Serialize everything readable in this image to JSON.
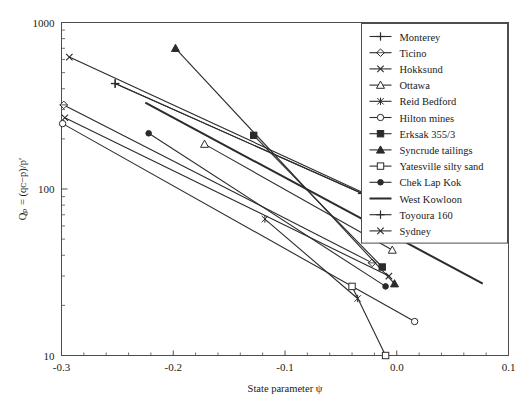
{
  "figure": {
    "background": "#ffffff",
    "frame_color": "#4d4d4d",
    "line_color": "#2b2b2b"
  },
  "axes": {
    "x": {
      "label": "State parameter ψ",
      "ticklabels": [
        "-0.3",
        "-0.2",
        "-0.1",
        "0.0",
        "0.1"
      ],
      "tickvalues": [
        -0.3,
        -0.2,
        -0.1,
        0.0,
        0.1
      ],
      "min": -0.3,
      "max": 0.1,
      "scale": "linear"
    },
    "y": {
      "label": "Qₚ = (qᴄ−p)/p′",
      "ticklabels": [
        "10",
        "100",
        "1000"
      ],
      "tickvalues": [
        10,
        100,
        1000
      ],
      "min": 10,
      "max": 1000,
      "scale": "log"
    }
  },
  "legend": {
    "position": "upper-right",
    "entries": [
      {
        "label": "Monterey",
        "marker": "plus"
      },
      {
        "label": "Ticino",
        "marker": "diamond-open"
      },
      {
        "label": "Hokksund",
        "marker": "x"
      },
      {
        "label": "Ottawa",
        "marker": "triangle-open"
      },
      {
        "label": "Reid Bedford",
        "marker": "asterisk"
      },
      {
        "label": "Hilton mines",
        "marker": "circle-open"
      },
      {
        "label": "Erksak 355/3",
        "marker": "square-filled"
      },
      {
        "label": "Syncrude tailings",
        "marker": "triangle-filled"
      },
      {
        "label": "Yatesville silty sand",
        "marker": "square-open"
      },
      {
        "label": "Chek Lap Kok",
        "marker": "circle-filled"
      },
      {
        "label": "West Kowloon",
        "marker": "none"
      },
      {
        "label": "Toyoura 160",
        "marker": "plus"
      },
      {
        "label": "Sydney",
        "marker": "x"
      }
    ]
  },
  "chart_data": {
    "type": "line",
    "title": "",
    "xlabel": "State parameter ψ",
    "ylabel": "Qₚ = (qᴄ−p)/p′",
    "xlim": [
      -0.3,
      0.1
    ],
    "ylim": [
      10,
      1000
    ],
    "yscale": "log",
    "grid": false,
    "legend_position": "upper-right",
    "series": [
      {
        "name": "Monterey",
        "marker": "plus",
        "x": [
          -0.252,
          -0.031
        ],
        "y": [
          430,
          94
        ]
      },
      {
        "name": "Ticino",
        "marker": "diamond-open",
        "x": [
          -0.298,
          -0.022
        ],
        "y": [
          320,
          36
        ]
      },
      {
        "name": "Hokksund",
        "marker": "x",
        "x": [
          -0.297,
          -0.007
        ],
        "y": [
          268,
          30
        ]
      },
      {
        "name": "Ottawa",
        "marker": "triangle-open",
        "x": [
          -0.172,
          -0.004
        ],
        "y": [
          186,
          43
        ]
      },
      {
        "name": "Reid Bedford",
        "marker": "asterisk",
        "x": [
          -0.118,
          -0.035
        ],
        "y": [
          66,
          22
        ]
      },
      {
        "name": "Hilton mines",
        "marker": "circle-open",
        "x": [
          -0.299,
          0.016
        ],
        "y": [
          247,
          16
        ]
      },
      {
        "name": "Erksak 355/3",
        "marker": "square-filled",
        "x": [
          -0.128,
          -0.013
        ],
        "y": [
          210,
          34
        ]
      },
      {
        "name": "Syncrude tailings",
        "marker": "triangle-filled",
        "x": [
          -0.198,
          -0.002
        ],
        "y": [
          700,
          27
        ]
      },
      {
        "name": "Yatesville silty sand",
        "marker": "square-open",
        "x": [
          -0.04,
          -0.01
        ],
        "y": [
          26,
          10
        ]
      },
      {
        "name": "Chek Lap Kok",
        "marker": "circle-filled",
        "x": [
          -0.222,
          -0.01
        ],
        "y": [
          216,
          26
        ]
      },
      {
        "name": "West Kowloon",
        "marker": "none",
        "x": [
          -0.225,
          0.077
        ],
        "y": [
          330,
          27
        ]
      },
      {
        "name": "Toyoura 160",
        "marker": "plus",
        "x": [
          -0.252,
          -0.031
        ],
        "y": [
          430,
          94
        ]
      },
      {
        "name": "Sydney",
        "marker": "x",
        "x": [
          -0.293,
          -0.027
        ],
        "y": [
          620,
          93
        ]
      }
    ]
  }
}
